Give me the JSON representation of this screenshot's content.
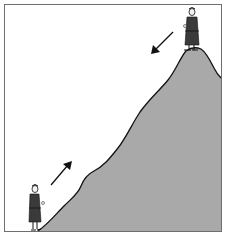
{
  "figure": {
    "colors": {
      "background": "#ffffff",
      "frame": "#6e6e6e",
      "mountain_fill": "#a9a9a9",
      "outline": "#111111",
      "robe": "#3a3a3a",
      "skin": "#f2f2f2"
    },
    "elements": {
      "frame": "square border around scene",
      "mountain": "gray slope rising from bottom-left to a rounded peak at top-right",
      "monk_top": "monk standing on mountain summit",
      "monk_bottom": "monk standing at foot of mountain",
      "arrow_up": "arrow pointing up the slope",
      "arrow_down": "arrow pointing down the slope"
    }
  }
}
